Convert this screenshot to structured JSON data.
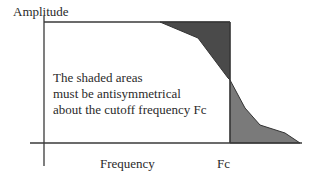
{
  "diagram": {
    "y_axis_label": "Amplitude",
    "x_axis_label": "Frequency",
    "cutoff_label": "Fc",
    "note_lines": [
      "The shaded areas",
      "must be antisymmetrical",
      "about the cutoff frequency Fc"
    ],
    "colors": {
      "line": "#3a3a3a",
      "shade_upper": "#4a4a4a",
      "shade_lower": "#7a7a7a",
      "text": "#2a2a2a",
      "background": "#ffffff"
    }
  }
}
